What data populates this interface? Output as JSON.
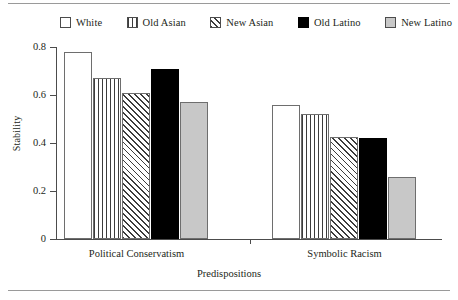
{
  "chart_data": {
    "type": "bar",
    "title": "",
    "xlabel": "Predispositions",
    "ylabel": "Stability",
    "categories": [
      "Political Conservatism",
      "Symbolic Racism"
    ],
    "ylim": [
      0,
      0.8
    ],
    "yticks": [
      "0",
      "0.2",
      "0.4",
      "0.6",
      "0.8"
    ],
    "ytick_values": [
      0,
      0.2,
      0.4,
      0.6,
      0.8
    ],
    "grid": false,
    "legend_position": "top",
    "series": [
      {
        "name": "White",
        "pattern": "empty",
        "swatch_icon": "empty-square-icon",
        "color": "#ffffff",
        "values": [
          0.78,
          0.56
        ]
      },
      {
        "name": "Old Asian",
        "pattern": "vertical-stripes",
        "swatch_icon": "vertical-stripe-square-icon",
        "color": "#3c3c3c",
        "values": [
          0.67,
          0.52
        ]
      },
      {
        "name": "New Asian",
        "pattern": "diagonal-hatch",
        "swatch_icon": "diagonal-hatch-square-icon",
        "color": "#3c3c3c",
        "values": [
          0.61,
          0.425
        ]
      },
      {
        "name": "Old Latino",
        "pattern": "solid-black",
        "swatch_icon": "solid-black-square-icon",
        "color": "#000000",
        "values": [
          0.71,
          0.42
        ]
      },
      {
        "name": "New Latino",
        "pattern": "solid-gray",
        "swatch_icon": "solid-gray-square-icon",
        "color": "#c8c8c8",
        "values": [
          0.57,
          0.26
        ]
      }
    ]
  }
}
